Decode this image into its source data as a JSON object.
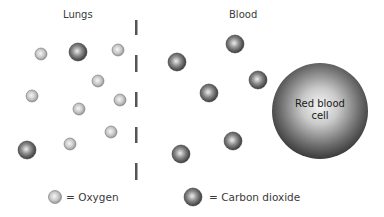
{
  "headings": {
    "left": "Lungs",
    "right": "Blood"
  },
  "red_blood_cell": {
    "label_line1": "Red blood",
    "label_line2": "cell",
    "cx": 320,
    "cy": 111,
    "r": 48
  },
  "legend": {
    "oxygen_label": "= Oxygen",
    "co2_label": "= Carbon dioxide"
  },
  "membrane_dashes": [
    {
      "y1": 20,
      "y2": 35
    },
    {
      "y1": 55,
      "y2": 72
    },
    {
      "y1": 92,
      "y2": 107
    },
    {
      "y1": 127,
      "y2": 143
    },
    {
      "y1": 163,
      "y2": 180
    }
  ],
  "molecules": {
    "oxygen": [
      {
        "cx": 41,
        "cy": 54
      },
      {
        "cx": 118,
        "cy": 50
      },
      {
        "cx": 98,
        "cy": 81
      },
      {
        "cx": 32,
        "cy": 96
      },
      {
        "cx": 120,
        "cy": 100
      },
      {
        "cx": 79,
        "cy": 109
      },
      {
        "cx": 111,
        "cy": 132
      },
      {
        "cx": 70,
        "cy": 144
      }
    ],
    "carbon_dioxide": [
      {
        "cx": 78,
        "cy": 52
      },
      {
        "cx": 27,
        "cy": 150
      },
      {
        "cx": 235,
        "cy": 44
      },
      {
        "cx": 177,
        "cy": 62
      },
      {
        "cx": 258,
        "cy": 80
      },
      {
        "cx": 209,
        "cy": 93
      },
      {
        "cx": 233,
        "cy": 141
      },
      {
        "cx": 181,
        "cy": 154
      }
    ]
  },
  "colors": {
    "oxygen_fill_light": "#f2f2f2",
    "oxygen_fill_dark": "#9a9a9a",
    "co2_fill_light": "#e8e8e8",
    "co2_fill_dark": "#3c3c3c",
    "rbc_center": "#f4f4f4",
    "rbc_edge": "#3a3a3a",
    "dash": "#555555"
  }
}
